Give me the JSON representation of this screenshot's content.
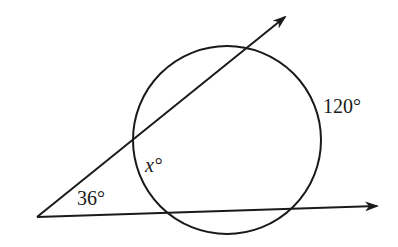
{
  "diagram": {
    "type": "circle with two secants from external point",
    "labels": {
      "vertex_angle": "36°",
      "near_arc": "x°",
      "far_arc": "120°"
    },
    "colors": {
      "stroke": "#1a1a1a",
      "background": "#ffffff"
    }
  }
}
